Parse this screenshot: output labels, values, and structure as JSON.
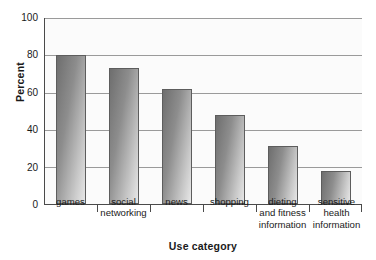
{
  "chart_data": {
    "type": "bar",
    "title": "",
    "xlabel": "Use category",
    "ylabel": "Percent",
    "categories": [
      "games",
      "social networking",
      "news",
      "shopping",
      "dieting and fitness information",
      "sensitive health information"
    ],
    "category_lines": [
      [
        "games"
      ],
      [
        "social",
        "networking"
      ],
      [
        "news"
      ],
      [
        "shopping"
      ],
      [
        "dieting",
        "and fitness",
        "information"
      ],
      [
        "sensitive",
        "health",
        "information"
      ]
    ],
    "values": [
      80,
      73,
      62,
      48,
      31,
      17.5
    ],
    "ylim": [
      0,
      100
    ],
    "ytick_labels": [
      "0",
      "20",
      "40",
      "60",
      "80",
      "100"
    ],
    "ytick_values": [
      0,
      20,
      40,
      60,
      80,
      100
    ],
    "grid": "horizontal",
    "legend": "none",
    "bar_color_dark": "#6e6e6e",
    "bar_color_light": "#e8e8e8",
    "bar_border_color": "#5d5d5d",
    "gridline_color": "#9a9a9a",
    "axis_color": "#4a4a4a",
    "plot_background": "#fbfbfb"
  }
}
